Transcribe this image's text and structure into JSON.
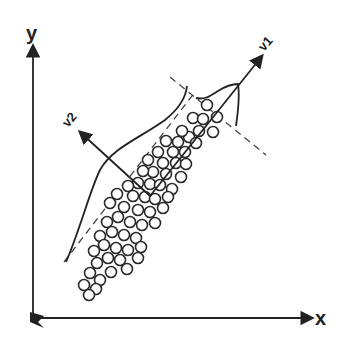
{
  "diagram": {
    "type": "PCA principal component illustration",
    "axes": {
      "x_label": "x",
      "y_label": "y"
    },
    "vectors": [
      {
        "name": "v1",
        "label": "v1",
        "direction": "major axis (up-right)"
      },
      {
        "name": "v2",
        "label": "v2",
        "direction": "minor axis (up-left)"
      }
    ],
    "elements": {
      "scatter_points": "open circles forming elongated diagonal cloud",
      "distribution_curves": [
        "projection density along v1",
        "projection density along v2"
      ],
      "dashed_lines": [
        "boundary along v1 direction",
        "boundary perpendicular to v1"
      ]
    },
    "colors": {
      "stroke": "#222222",
      "background": "#ffffff"
    }
  }
}
